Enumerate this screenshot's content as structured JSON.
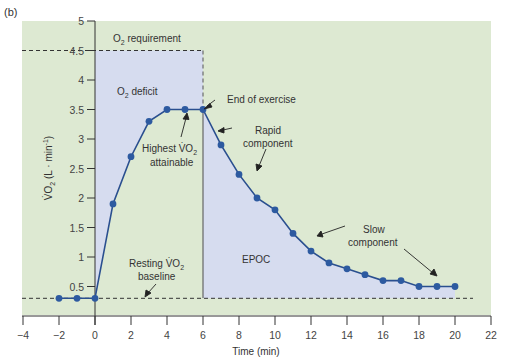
{
  "figure_label": "(b)",
  "colors": {
    "background_green": "#dde9d2",
    "deficit_blue": "#d6dcef",
    "line": "#2a4f8f",
    "marker": "#2d5aa0",
    "axis": "#333333"
  },
  "chart_data": {
    "type": "line",
    "title": "",
    "xlabel": "Time (min)",
    "ylabel": "V̇O₂ (L · min⁻¹)",
    "xlim": [
      -4,
      22
    ],
    "ylim": [
      0,
      5
    ],
    "x_ticks": [
      -4,
      -2,
      0,
      2,
      4,
      6,
      8,
      10,
      12,
      14,
      16,
      18,
      20,
      22
    ],
    "x_tick_labels": [
      "−4",
      "−2",
      "0",
      "2",
      "4",
      "6",
      "8",
      "10",
      "12",
      "14",
      "16",
      "18",
      "20",
      "22"
    ],
    "y_ticks": [
      0.5,
      1,
      1.5,
      2,
      2.5,
      3,
      3.5,
      4,
      4.5,
      5
    ],
    "y_tick_labels": [
      "0.5",
      "1",
      "1.5",
      "2",
      "2.5",
      "3",
      "3.5",
      "4",
      "4.5",
      "5"
    ],
    "grid": false,
    "legend": null,
    "series": [
      {
        "name": "VO2",
        "x": [
          -2,
          -1,
          0,
          1,
          2,
          3,
          4,
          5,
          6,
          7,
          8,
          9,
          10,
          11,
          12,
          13,
          14,
          15,
          16,
          17,
          18,
          19,
          20
        ],
        "values": [
          0.3,
          0.3,
          0.3,
          1.9,
          2.7,
          3.3,
          3.5,
          3.5,
          3.5,
          2.9,
          2.4,
          2.0,
          1.8,
          1.4,
          1.1,
          0.9,
          0.8,
          0.7,
          0.6,
          0.6,
          0.5,
          0.5,
          0.5
        ]
      }
    ],
    "reference_lines": [
      {
        "name": "O2 requirement",
        "y": 4.5,
        "x_range": [
          0,
          6
        ],
        "style": "dashed"
      },
      {
        "name": "Resting VO2 baseline",
        "y": 0.3,
        "x_range": [
          -4,
          21
        ],
        "style": "dashed"
      },
      {
        "name": "End of exercise",
        "x": 6,
        "style": "dashed above curve, solid below"
      }
    ],
    "shaded_regions": [
      {
        "name": "O2 deficit",
        "description": "area between O2 requirement (4.5) and VO2 curve, t=0 to 6"
      },
      {
        "name": "EPOC",
        "description": "area under VO2 curve above baseline, t=6 to 20"
      }
    ],
    "annotations": [
      {
        "text": "O2 requirement",
        "x": 2.5,
        "y": 4.75
      },
      {
        "text": "O2 deficit",
        "x": 2,
        "y": 3.9
      },
      {
        "text": "End of exercise",
        "x": 8.5,
        "y": 3.6
      },
      {
        "text": "Highest VO2 attainable",
        "x": 4,
        "y": 2.9
      },
      {
        "text": "Rapid component",
        "x": 9,
        "y": 3.2
      },
      {
        "text": "Slow component",
        "x": 16,
        "y": 1.3
      },
      {
        "text": "Resting VO2 baseline",
        "x": 3,
        "y": 0.75
      },
      {
        "text": "EPOC",
        "x": 8.7,
        "y": 0.8
      }
    ]
  },
  "annotations": {
    "o2_requirement_pre": "O",
    "o2_requirement_sub": "2",
    "o2_requirement_post": " requirement",
    "o2_deficit_pre": "O",
    "o2_deficit_sub": "2",
    "o2_deficit_post": " deficit",
    "end_of_exercise": "End of exercise",
    "highest_line1_pre": "Highest V̇O",
    "highest_line1_sub": "2",
    "highest_line2": "attainable",
    "rapid_line1": "Rapid",
    "rapid_line2": "component",
    "slow_line1": "Slow",
    "slow_line2": "component",
    "resting_line1_pre": "Resting V̇O",
    "resting_line1_sub": "2",
    "resting_line2": "baseline",
    "epoc": "EPOC"
  },
  "axes": {
    "x_title": "Time (min)",
    "y_title_pre": "V̇O",
    "y_title_sub": "2",
    "y_title_post": " (L · min",
    "y_title_sup": "-1",
    "y_title_end": ")"
  }
}
